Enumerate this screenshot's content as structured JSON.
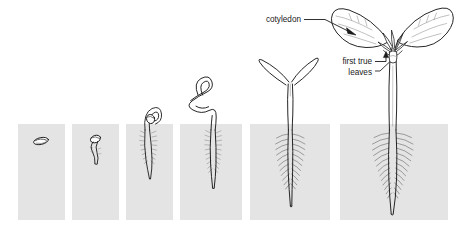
{
  "figure": {
    "background_color": "#ffffff",
    "soil_color": "#e4e4e4",
    "ink_color": "#1a1a1a",
    "stage_count": 6
  },
  "labels": {
    "cotyledon": "cotyledon",
    "first_true_leaves_line1": "first true",
    "first_true_leaves_line2": "leaves"
  },
  "panels": [
    {
      "id": "panel-1",
      "x": 18,
      "y": 124,
      "w": 47,
      "h": 96,
      "stage": "seed"
    },
    {
      "id": "panel-2",
      "x": 72,
      "y": 124,
      "w": 47,
      "h": 96,
      "stage": "radicle-emerging"
    },
    {
      "id": "panel-3",
      "x": 126,
      "y": 124,
      "w": 47,
      "h": 96,
      "stage": "hypocotyl-hook"
    },
    {
      "id": "panel-4",
      "x": 180,
      "y": 124,
      "w": 62,
      "h": 96,
      "stage": "hook-straightening"
    },
    {
      "id": "panel-5",
      "x": 250,
      "y": 124,
      "w": 80,
      "h": 96,
      "stage": "cotyledons-expanded"
    },
    {
      "id": "panel-6",
      "x": 340,
      "y": 124,
      "w": 108,
      "h": 96,
      "stage": "first-true-leaves"
    }
  ],
  "annotations": [
    {
      "name": "cotyledon-annotation",
      "text_x": 256,
      "text_y": 22,
      "leader": "M 301 19 L 322 19 L 351 32",
      "arrow_at": [
        355,
        34
      ]
    },
    {
      "name": "first-true-leaves-annotation",
      "text_x": 333,
      "text_y": 65,
      "text2_y": 76,
      "leader": "M 374 62 L 387 62 L 387 55",
      "leader2": "M 374 72 L 383 72 L 392 63",
      "arrow_at": [
        388,
        52
      ]
    }
  ]
}
